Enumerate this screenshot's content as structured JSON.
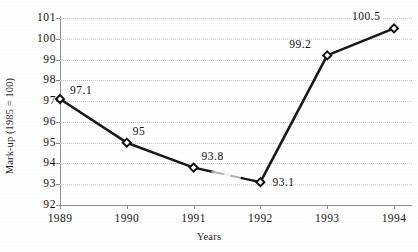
{
  "chart_data": {
    "type": "line",
    "title": "",
    "xlabel": "Years",
    "ylabel": "Mark-up (1985 = 100)",
    "categories": [
      "1989",
      "1990",
      "1991",
      "1992",
      "1993",
      "1994"
    ],
    "values": [
      97.1,
      95,
      93.8,
      93.1,
      99.2,
      100.5
    ],
    "point_labels": [
      "97.1",
      "95",
      "93.8",
      "93.1",
      "99.2",
      "100.5"
    ],
    "ylim": [
      92,
      101
    ],
    "ytick_labels": [
      "101",
      "100",
      "99",
      "98",
      "97",
      "96",
      "95",
      "94",
      "93",
      "92"
    ],
    "ytick_values": [
      101,
      100,
      99,
      98,
      97,
      96,
      95,
      94,
      93,
      92
    ],
    "grid": "horizontal-dotted",
    "legend": "none",
    "series": [
      {
        "name": "Mark-up",
        "values": [
          97.1,
          95,
          93.8,
          93.1,
          99.2,
          100.5
        ],
        "marker": "diamond",
        "line_color": "#1a1a1a",
        "marker_fill": "#ffffff",
        "marker_edge": "#111111"
      }
    ],
    "colors": {
      "line": "#1a1a1a",
      "axis": "#8d8d8d",
      "gridline": "#c9c9cf",
      "text": "#161616",
      "background": "#ffffff"
    },
    "annotations": [
      {
        "kind": "faded-line-segment",
        "between": [
          "1991",
          "1992"
        ],
        "note": "scan artifact: line partially faded"
      }
    ]
  }
}
